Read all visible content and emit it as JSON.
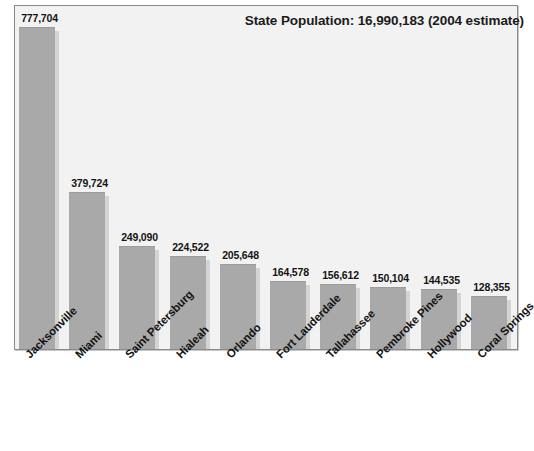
{
  "chart_data": {
    "type": "bar",
    "title": "State Population: 16,990,183 (2004 estimate)",
    "xlabel": "",
    "ylabel": "",
    "ylim": [
      0,
      820000
    ],
    "grid": false,
    "legend": "none",
    "categories": [
      "Jacksonville",
      "Miami",
      "Saint Petersburg",
      "Hialeah",
      "Orlando",
      "Fort Lauderdale",
      "Tallahassee",
      "Pembroke Pines",
      "Hollywood",
      "Coral Springs"
    ],
    "values": [
      777704,
      379724,
      249090,
      224522,
      205648,
      164578,
      156612,
      150104,
      144535,
      128355
    ],
    "value_labels": [
      "777,704",
      "379,724",
      "249,090",
      "224,522",
      "205,648",
      "164,578",
      "156,612",
      "150,104",
      "144,535",
      "128,355"
    ],
    "colors": {
      "bar_fill": "#a9a9a9",
      "bar_shadow": "#d4d4d4",
      "plot_background": "#f2f2f2",
      "frame": "#8a8a8a",
      "text": "#141414"
    }
  }
}
